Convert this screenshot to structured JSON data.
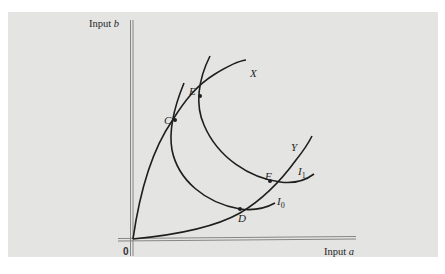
{
  "figure": {
    "y_axis_label": "Input",
    "y_axis_var": "b",
    "x_axis_label": "Input",
    "x_axis_var": "a",
    "origin_label": "0",
    "rays": [
      {
        "name": "X",
        "label": "X"
      },
      {
        "name": "Y",
        "label": "Y"
      }
    ],
    "isoquants": [
      {
        "name": "I0",
        "base": "I",
        "sub": "0"
      },
      {
        "name": "I1",
        "base": "I",
        "sub": "1"
      }
    ],
    "points": [
      {
        "name": "C",
        "label": "C"
      },
      {
        "name": "E",
        "label": "E"
      },
      {
        "name": "D",
        "label": "D"
      },
      {
        "name": "F",
        "label": "F"
      }
    ]
  },
  "colors": {
    "panel": "#e4e4e2",
    "ink": "#1e1e1e",
    "axis": "#7a7a7a"
  }
}
